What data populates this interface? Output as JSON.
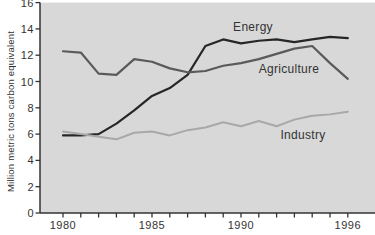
{
  "chart_data": {
    "type": "line",
    "title": "",
    "xlabel": "",
    "ylabel": "Million metric tons carbon equivalent",
    "ylim": [
      0,
      16
    ],
    "yticks": [
      0,
      2,
      4,
      6,
      8,
      10,
      12,
      14,
      16
    ],
    "years": [
      1980,
      1981,
      1982,
      1983,
      1984,
      1985,
      1986,
      1987,
      1988,
      1989,
      1990,
      1991,
      1992,
      1993,
      1994,
      1995,
      1996
    ],
    "xtick_years": [
      1980,
      1985,
      1990,
      1996
    ],
    "xtick_labels": [
      "1980",
      "1985",
      "1990",
      "1996"
    ],
    "grid": false,
    "legend_position": "inline-labels",
    "colors": {
      "background": "#ffffff",
      "plot_bg": "#d8d8d8",
      "axis": "#333333"
    },
    "series": [
      {
        "name": "Energy",
        "color": "#262626",
        "label_color": "#333333",
        "width": 2.2,
        "values": [
          5.9,
          5.9,
          6.0,
          6.8,
          7.8,
          8.9,
          9.5,
          10.5,
          12.7,
          13.2,
          12.9,
          13.1,
          13.2,
          13.0,
          13.2,
          13.4,
          13.3
        ],
        "label_px": {
          "x": 253,
          "y": 31
        }
      },
      {
        "name": "Agriculture",
        "color": "#5a5a5a",
        "label_color": "#3d3d3d",
        "width": 2.2,
        "values": [
          12.3,
          12.2,
          10.6,
          10.5,
          11.7,
          11.5,
          11.0,
          10.7,
          10.8,
          11.2,
          11.4,
          11.7,
          12.1,
          12.5,
          12.7,
          11.4,
          10.2
        ],
        "label_px": {
          "x": 289,
          "y": 73
        }
      },
      {
        "name": "Industry",
        "color": "#a8a8a8",
        "label_color": "#555555",
        "width": 2.0,
        "values": [
          6.2,
          6.0,
          5.8,
          5.6,
          6.1,
          6.2,
          5.9,
          6.3,
          6.5,
          6.9,
          6.6,
          7.0,
          6.6,
          7.1,
          7.4,
          7.5,
          7.7
        ],
        "label_px": {
          "x": 303,
          "y": 139
        }
      }
    ]
  }
}
